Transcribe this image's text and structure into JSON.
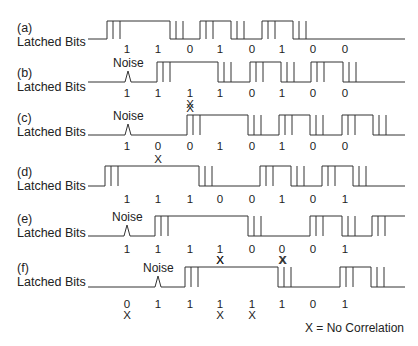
{
  "rows": [
    {
      "id": "a",
      "letter": "(a)",
      "caption": "Latched Bits",
      "label_y": 31,
      "high": 21,
      "low": 39,
      "start_level": "low",
      "transitions": [
        107,
        170,
        200,
        231,
        262,
        293
      ],
      "noise": null,
      "bits": [
        "1",
        "1",
        "0",
        "1",
        "0",
        "1",
        "0",
        "0"
      ],
      "bits_y": 43,
      "x_marks_wave": [],
      "x_marks_below": []
    },
    {
      "id": "b",
      "letter": "(b)",
      "caption": "Latched Bits",
      "label_y": 76,
      "high": 62,
      "low": 82,
      "start_level": "low",
      "transitions": [
        157,
        218,
        250,
        281,
        311,
        343
      ],
      "noise": {
        "x": 128,
        "label": "Noise"
      },
      "bits": [
        "1",
        "1",
        "1",
        "1",
        "0",
        "1",
        "0",
        "0"
      ],
      "bits_y": 87,
      "x_marks_wave": [],
      "x_marks_below": [
        {
          "bit": 2,
          "label": "X"
        }
      ]
    },
    {
      "id": "c",
      "letter": "(c)",
      "caption": "Latched Bits",
      "label_y": 121,
      "high": 115,
      "low": 135,
      "start_level": "low",
      "transitions": [
        187,
        248,
        279,
        310,
        342,
        373
      ],
      "noise": {
        "x": 128,
        "label": "Noise"
      },
      "bits": [
        "1",
        "0",
        "0",
        "1",
        "0",
        "1",
        "0",
        "0"
      ],
      "bits_y": 140,
      "x_marks_wave": [
        {
          "x": 190,
          "label": "X"
        }
      ],
      "x_marks_below": []
    },
    {
      "id": "d",
      "letter": "(d)",
      "caption": "Latched Bits",
      "label_y": 175,
      "high": 166,
      "low": 186,
      "start_level": "low",
      "transitions": [
        105,
        199,
        260,
        291,
        322,
        353
      ],
      "noise": null,
      "bits": [
        "1",
        "1",
        "1",
        "0",
        "0",
        "1",
        "0",
        "1"
      ],
      "bits_y": 193,
      "x_marks_wave": [
        {
          "x": 158,
          "label": "X"
        }
      ],
      "x_marks_below": []
    },
    {
      "id": "e",
      "letter": "(e)",
      "caption": "Latched Bits",
      "label_y": 222,
      "high": 216,
      "low": 236,
      "start_level": "low",
      "transitions": [
        155,
        248,
        310,
        342,
        372
      ],
      "noise": {
        "x": 127,
        "label": "Noise"
      },
      "bits": [
        "1",
        "1",
        "1",
        "1",
        "0",
        "0",
        "0",
        "1"
      ],
      "bits_y": 243,
      "x_marks_wave": [],
      "x_marks_below": [
        {
          "bit": 3,
          "label": "X"
        },
        {
          "bit": 5,
          "label": "X"
        }
      ]
    },
    {
      "id": "f",
      "letter": "(f)",
      "caption": "Latched Bits",
      "label_y": 271,
      "high": 267,
      "low": 287,
      "start_level": "low",
      "transitions": [
        185,
        278,
        340,
        371
      ],
      "noise": {
        "x": 158,
        "label": "Noise"
      },
      "bits": [
        "0",
        "1",
        "1",
        "1",
        "1",
        "1",
        "0",
        "1"
      ],
      "bits_y": 298,
      "x_marks_wave": [
        {
          "x": 220,
          "label": "X"
        },
        {
          "x": 283,
          "label": "X"
        }
      ],
      "x_marks_below": [
        {
          "bit": 0,
          "label": "X"
        },
        {
          "bit": 3,
          "label": "X"
        },
        {
          "bit": 4,
          "label": "X"
        }
      ]
    }
  ],
  "bit_columns": [
    127,
    158,
    190,
    220,
    252,
    282,
    313,
    345
  ],
  "wave_start_x": 88,
  "wave_end_x": 405,
  "legend": "X = No Correlation",
  "colors": {
    "line": "#333333",
    "text": "#222222"
  }
}
